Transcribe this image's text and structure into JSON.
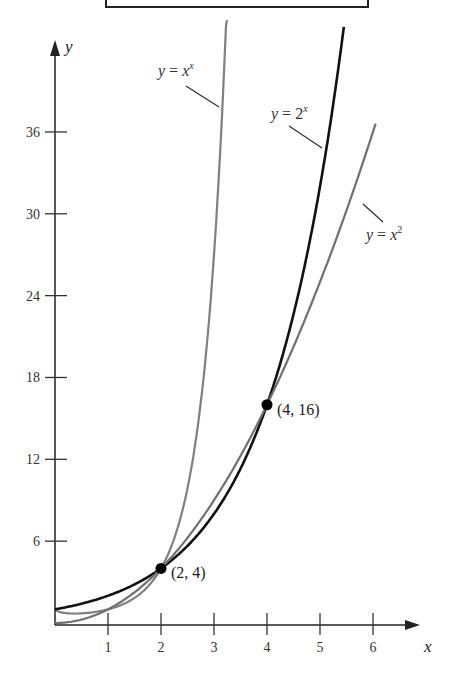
{
  "chart_data": {
    "type": "line",
    "title": "",
    "xlabel": "x",
    "ylabel": "y",
    "xlim": [
      0,
      6.8
    ],
    "ylim": [
      0,
      43
    ],
    "x_ticks": [
      1,
      2,
      3,
      4,
      5,
      6
    ],
    "y_ticks": [
      6,
      12,
      18,
      24,
      30,
      36
    ],
    "grid": false,
    "legend": "inline labels",
    "series": [
      {
        "name": "y = x^x",
        "label_base": "y = x",
        "label_sup": "x",
        "color": "#808080",
        "x": [
          0.05,
          0.37,
          0.5,
          1,
          1.5,
          2,
          2.5,
          3,
          3.2,
          3.35
        ],
        "values": [
          0.86,
          0.69,
          0.71,
          1,
          1.84,
          4,
          9.88,
          27,
          41.4,
          57.4
        ]
      },
      {
        "name": "y = 2^x",
        "label_base": "y = 2",
        "label_sup": "x",
        "color": "#111111",
        "x": [
          0,
          1,
          2,
          3,
          4,
          5,
          5.4
        ],
        "values": [
          1,
          2,
          4,
          8,
          16,
          32,
          42.2
        ]
      },
      {
        "name": "y = x^2",
        "label_base": "y = x",
        "label_sup": "2",
        "color": "#707070",
        "x": [
          0,
          1,
          2,
          3,
          4,
          5,
          6
        ],
        "values": [
          0,
          1,
          4,
          9,
          16,
          25,
          36
        ]
      }
    ],
    "annotations": [
      {
        "label": "(2, 4)",
        "x": 2,
        "y": 4
      },
      {
        "label": "(4, 16)",
        "x": 4,
        "y": 16
      }
    ]
  }
}
